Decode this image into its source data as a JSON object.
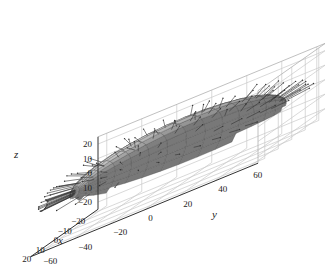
{
  "chart_data": {
    "type": "surface3d",
    "title": "",
    "surface": {
      "shape": "ellipsoid",
      "semi_axes": {
        "x": 20,
        "y": 60,
        "z": 20
      },
      "center": {
        "x": 0,
        "y": 0,
        "z": 0
      },
      "mesh_color": "#333333",
      "shading": "grayscale",
      "normal_arrows": true
    },
    "axes": {
      "x": {
        "label": "x",
        "ticks": [
          -20,
          -10,
          0,
          10,
          20
        ],
        "range": [
          -25,
          25
        ]
      },
      "y": {
        "label": "y",
        "ticks": [
          -60,
          -40,
          -20,
          0,
          20,
          40,
          60
        ],
        "range": [
          -65,
          65
        ]
      },
      "z": {
        "label": "z",
        "ticks": [
          -20,
          -10,
          0,
          10,
          20
        ],
        "range": [
          -25,
          25
        ]
      }
    },
    "tick_labels_rendered": {
      "z": [
        "20",
        "10",
        "0",
        "10",
        "−20"
      ],
      "x": [
        "−20",
        "−10",
        "0",
        "10",
        "20"
      ],
      "y": [
        "−60",
        "−40",
        "−20",
        "0",
        "20",
        "40",
        "60"
      ]
    },
    "grid": true,
    "box": true
  },
  "labels": {
    "x": "x",
    "y": "y",
    "z": "z"
  }
}
